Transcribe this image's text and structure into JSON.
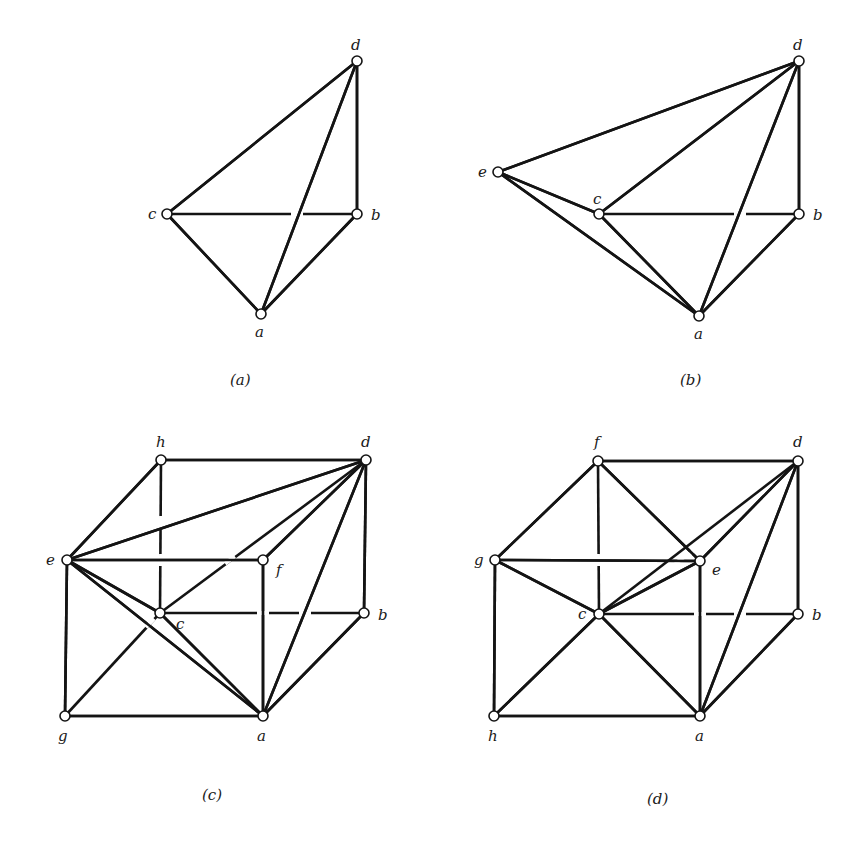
{
  "figure": {
    "background": "#ffffff",
    "line_color": "#141414",
    "diagrams": [
      {
        "id": "a",
        "caption": "(a)",
        "caption_pos": [
          230,
          385
        ],
        "vertices": {
          "d": {
            "pos": [
              357,
              61
            ],
            "label": "d",
            "label_pos": [
              351,
              50
            ]
          },
          "c": {
            "pos": [
              167,
              214
            ],
            "label": "c",
            "label_pos": [
              148,
              219
            ]
          },
          "b": {
            "pos": [
              357,
              214
            ],
            "label": "b",
            "label_pos": [
              371,
              220
            ]
          },
          "a": {
            "pos": [
              261,
              314
            ],
            "label": "a",
            "label_pos": [
              255,
              337
            ]
          }
        },
        "edges": [
          {
            "from": "c",
            "to": "d"
          },
          {
            "from": "d",
            "to": "b"
          },
          {
            "from": "c",
            "to": "b",
            "gaps": [
              [
                297,
                214
              ]
            ]
          },
          {
            "from": "c",
            "to": "a"
          },
          {
            "from": "a",
            "to": "b"
          },
          {
            "from": "a",
            "to": "d"
          }
        ]
      },
      {
        "id": "b",
        "caption": "(b)",
        "caption_pos": [
          680,
          385
        ],
        "vertices": {
          "d": {
            "pos": [
              799,
              61
            ],
            "label": "d",
            "label_pos": [
              793,
              50
            ]
          },
          "e": {
            "pos": [
              498,
              172
            ],
            "label": "e",
            "label_pos": [
              478,
              177
            ]
          },
          "c": {
            "pos": [
              599,
              214
            ],
            "label": "c",
            "label_pos": [
              593,
              204
            ]
          },
          "b": {
            "pos": [
              799,
              214
            ],
            "label": "b",
            "label_pos": [
              813,
              220
            ]
          },
          "a": {
            "pos": [
              699,
              316
            ],
            "label": "a",
            "label_pos": [
              694,
              339
            ]
          }
        },
        "edges": [
          {
            "from": "e",
            "to": "d"
          },
          {
            "from": "e",
            "to": "c"
          },
          {
            "from": "e",
            "to": "a"
          },
          {
            "from": "c",
            "to": "d"
          },
          {
            "from": "c",
            "to": "b",
            "gaps": [
              [
                740,
                214
              ]
            ]
          },
          {
            "from": "c",
            "to": "a"
          },
          {
            "from": "a",
            "to": "d"
          },
          {
            "from": "a",
            "to": "b"
          },
          {
            "from": "d",
            "to": "b"
          }
        ]
      },
      {
        "id": "c",
        "caption": "(c)",
        "caption_pos": [
          202,
          800
        ],
        "vertices": {
          "h": {
            "pos": [
              161,
              460
            ],
            "label": "h",
            "label_pos": [
              156,
              447
            ]
          },
          "d": {
            "pos": [
              366,
              460
            ],
            "label": "d",
            "label_pos": [
              361,
              447
            ]
          },
          "e": {
            "pos": [
              67,
              560
            ],
            "label": "e",
            "label_pos": [
              46,
              565
            ]
          },
          "f": {
            "pos": [
              263,
              560
            ],
            "label": "f",
            "label_pos": [
              276,
              575
            ]
          },
          "c": {
            "pos": [
              160,
              613
            ],
            "label": "c",
            "label_pos": [
              176,
              629
            ]
          },
          "b": {
            "pos": [
              364,
              613
            ],
            "label": "b",
            "label_pos": [
              378,
              620
            ]
          },
          "g": {
            "pos": [
              65,
              716
            ],
            "label": "g",
            "label_pos": [
              58,
              741
            ]
          },
          "a": {
            "pos": [
              263,
              716
            ],
            "label": "a",
            "label_pos": [
              257,
              741
            ]
          }
        },
        "edges": [
          {
            "from": "h",
            "to": "d"
          },
          {
            "from": "h",
            "to": "e"
          },
          {
            "from": "h",
            "to": "c",
            "gaps": [
              [
                161,
                522
              ],
              [
                161,
                560
              ]
            ]
          },
          {
            "from": "e",
            "to": "d"
          },
          {
            "from": "e",
            "to": "f"
          },
          {
            "from": "e",
            "to": "g"
          },
          {
            "from": "e",
            "to": "c"
          },
          {
            "from": "e",
            "to": "a"
          },
          {
            "from": "f",
            "to": "d"
          },
          {
            "from": "f",
            "to": "a"
          },
          {
            "from": "c",
            "to": "d",
            "gaps": [
              [
                230,
                560
              ]
            ]
          },
          {
            "from": "c",
            "to": "b",
            "gaps": [
              [
                263,
                613
              ],
              [
                305,
                613
              ]
            ]
          },
          {
            "from": "c",
            "to": "g",
            "gaps": [
              [
                150,
                623
              ]
            ]
          },
          {
            "from": "c",
            "to": "a"
          },
          {
            "from": "d",
            "to": "b"
          },
          {
            "from": "d",
            "to": "a"
          },
          {
            "from": "b",
            "to": "a"
          },
          {
            "from": "g",
            "to": "a"
          }
        ]
      },
      {
        "id": "d",
        "caption": "(d)",
        "caption_pos": [
          647,
          804
        ],
        "vertices": {
          "f": {
            "pos": [
              598,
              461
            ],
            "label": "f",
            "label_pos": [
              594,
              447
            ]
          },
          "d": {
            "pos": [
              798,
              461
            ],
            "label": "d",
            "label_pos": [
              793,
              447
            ]
          },
          "g": {
            "pos": [
              495,
              560
            ],
            "label": "g",
            "label_pos": [
              474,
              565
            ]
          },
          "e": {
            "pos": [
              700,
              561
            ],
            "label": "e",
            "label_pos": [
              712,
              575
            ]
          },
          "c": {
            "pos": [
              599,
              614
            ],
            "label": "c",
            "label_pos": [
              578,
              619
            ]
          },
          "b": {
            "pos": [
              798,
              614
            ],
            "label": "b",
            "label_pos": [
              812,
              620
            ]
          },
          "h": {
            "pos": [
              494,
              716
            ],
            "label": "h",
            "label_pos": [
              488,
              741
            ]
          },
          "a": {
            "pos": [
              700,
              716
            ],
            "label": "a",
            "label_pos": [
              695,
              741
            ]
          }
        },
        "edges": [
          {
            "from": "f",
            "to": "d"
          },
          {
            "from": "f",
            "to": "g"
          },
          {
            "from": "f",
            "to": "e"
          },
          {
            "from": "f",
            "to": "c",
            "gaps": [
              [
                598,
                560
              ]
            ]
          },
          {
            "from": "g",
            "to": "e"
          },
          {
            "from": "g",
            "to": "c"
          },
          {
            "from": "g",
            "to": "h"
          },
          {
            "from": "e",
            "to": "d"
          },
          {
            "from": "e",
            "to": "a"
          },
          {
            "from": "e",
            "to": "c"
          },
          {
            "from": "c",
            "to": "d",
            "gaps": [
              [
                680,
                560
              ],
              [
                695,
                550
              ]
            ]
          },
          {
            "from": "c",
            "to": "b",
            "gaps": [
              [
                700,
                614
              ],
              [
                740,
                614
              ]
            ]
          },
          {
            "from": "c",
            "to": "h"
          },
          {
            "from": "c",
            "to": "a"
          },
          {
            "from": "d",
            "to": "b"
          },
          {
            "from": "d",
            "to": "a"
          },
          {
            "from": "b",
            "to": "a"
          },
          {
            "from": "h",
            "to": "a"
          }
        ]
      }
    ]
  }
}
